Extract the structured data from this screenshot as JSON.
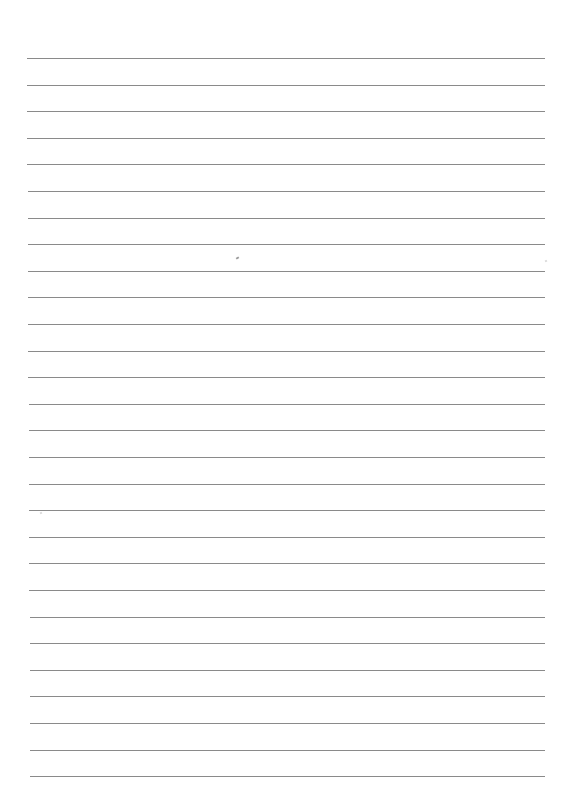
{
  "page": {
    "type": "lined-paper",
    "background_color": "#ffffff",
    "rule_color": "#8a8a8a",
    "rule_count": 28,
    "rule_left_px": 27,
    "rule_right_px": 545,
    "first_rule_y_px": 58,
    "rule_spacing_px": 26.6
  },
  "marks": [
    {
      "x": 236,
      "y": 257,
      "kind": "speck"
    },
    {
      "x": 40,
      "y": 512,
      "kind": "faint"
    },
    {
      "x": 545,
      "y": 260,
      "kind": "faint"
    }
  ]
}
